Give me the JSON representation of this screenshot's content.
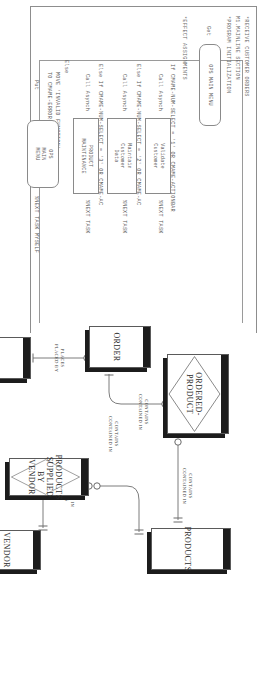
{
  "document": {
    "kind": "scanned-page",
    "orientation": "rotated-90-clockwise",
    "ink_color": "#4a4a4a"
  },
  "action_diagram": {
    "title_lines": [
      "*RECEIVE CUSTOMER ORDERS",
      "M1.MAINLINE SECTION",
      "*PROGRAM INITIALIZATION"
    ],
    "get_keyword": "Get",
    "effect_header": "*EFFECT ASSIGNMENTS",
    "branches": [
      {
        "condition": "If CMAME-NUM-SELECT = '1' OR CMAME-ACTIONBAR",
        "call": "Call Asynch",
        "box_label": "Validate\nCustomer",
        "box_shape": "process",
        "next": "%NEXT TASK"
      },
      {
        "condition": "Else If CMAME-NUM-SELECT = '2' OR CMAME-AC",
        "call": "Call Asynch",
        "box_label": "Maintain\nCustomer\nData",
        "box_shape": "process",
        "next": "%NEXT TASK"
      },
      {
        "condition": "Else If CMAME-NUM-SELECT = '3' OR CMAME-AC",
        "call": "Call Asynch",
        "box_label": "PRODUCT\nMAINTENANCE",
        "box_shape": "process",
        "next": "%NEXT TASK"
      }
    ],
    "else_branch": {
      "keyword": "Else",
      "move_lines": [
        "MOVE 'INVALID FUNCTION'",
        "TO CMAME-ERROR-MESSAGE"
      ],
      "put_keyword": "Put",
      "box_label": "OPS\nMAIN\nMENU",
      "box_shape": "screen",
      "next": "%NEXT TASK MYSELF"
    },
    "main_menu_box": {
      "label": "OPS MAIN MENU",
      "shape": "screen"
    }
  },
  "er_diagram": {
    "entities": [
      {
        "id": "ordered_product",
        "name": "ORDERED-PRODUCT",
        "type": "associative"
      },
      {
        "id": "products",
        "name": "PRODUCTS",
        "type": "entity"
      },
      {
        "id": "order",
        "name": "ORDER",
        "type": "entity"
      },
      {
        "id": "customer",
        "name": "CUSTOMER",
        "type": "entity"
      },
      {
        "id": "prod_sup_vendor",
        "name": "PRODUCTS\nSUPPLIED\nBY\nVENDOR",
        "type": "associative"
      },
      {
        "id": "vendor",
        "name": "VENDOR",
        "type": "entity"
      }
    ],
    "relationships": [
      {
        "from": "ordered_product",
        "to": "products",
        "forward": "CONTAINS",
        "reverse": "CONTAINED IN"
      },
      {
        "from": "order",
        "to": "ordered_product",
        "forward": "CONTAINS",
        "reverse": "CONTAINED IN"
      },
      {
        "from": "customer",
        "to": "order",
        "forward": "PLACES",
        "reverse": "PLACED BY"
      },
      {
        "from": "prod_sup_vendor",
        "to": "vendor",
        "forward": "CONTAINED IN",
        "reverse": "CONTAINS"
      },
      {
        "from": "products",
        "to": "prod_sup_vendor",
        "forward": "CONTAINS",
        "reverse": "CONTAINED IN"
      }
    ]
  }
}
